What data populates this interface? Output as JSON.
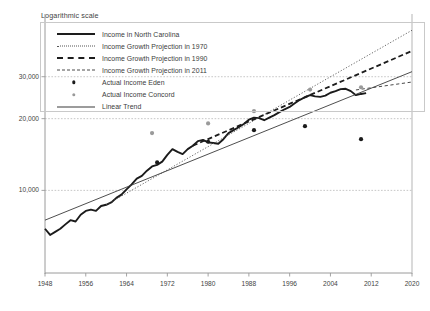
{
  "chart_data": {
    "type": "line",
    "title": "Logarithmic scale",
    "xlabel": "",
    "ylabel": "",
    "scale": "logarithmic",
    "grid": "horizontal",
    "legend_position": "top",
    "xlim": [
      1948,
      2020
    ],
    "ylim": [
      4500,
      55000
    ],
    "xticks": [
      "1948",
      "1956",
      "1964",
      "1972",
      "1980",
      "1988",
      "1996",
      "2004",
      "2012",
      "2020"
    ],
    "xtick_values": [
      1948,
      1956,
      1964,
      1972,
      1980,
      1988,
      1996,
      2004,
      2012,
      2020
    ],
    "yticks": [
      "10,000",
      "20,000",
      "30,000"
    ],
    "ytick_values": [
      10000,
      20000,
      30000
    ],
    "legend": [
      {
        "label": "Income in North Carolina",
        "key": "solid-thick"
      },
      {
        "label": "Income Growth Projection in 1970",
        "key": "dotted"
      },
      {
        "label": "Income Growth Projection in 1990",
        "key": "dashed-thick"
      },
      {
        "label": "Income Growth Projection in 2011",
        "key": "dashed-thin"
      },
      {
        "label": "Actual Income Eden",
        "key": "dot-dark"
      },
      {
        "label": "Actual Income Concord",
        "key": "dot-gray"
      },
      {
        "label": "Linear Trend",
        "key": "solid-thin"
      }
    ],
    "series": [
      {
        "name": "Income in North Carolina",
        "style": "solid-thick",
        "color": "#1b1b1b",
        "x": [
          1948,
          1949,
          1950,
          1951,
          1952,
          1953,
          1954,
          1955,
          1956,
          1957,
          1958,
          1959,
          1960,
          1961,
          1962,
          1963,
          1964,
          1965,
          1966,
          1967,
          1968,
          1969,
          1970,
          1971,
          1972,
          1973,
          1974,
          1975,
          1976,
          1977,
          1978,
          1979,
          1980,
          1981,
          1982,
          1983,
          1984,
          1985,
          1986,
          1987,
          1988,
          1989,
          1990,
          1991,
          1992,
          1993,
          1994,
          1995,
          1996,
          1997,
          1998,
          1999,
          2000,
          2001,
          2002,
          2003,
          2004,
          2005,
          2006,
          2007,
          2008,
          2009,
          2010,
          2011
        ],
        "values": [
          6900,
          6500,
          6700,
          6900,
          7200,
          7500,
          7400,
          7900,
          8200,
          8300,
          8200,
          8600,
          8700,
          8900,
          9300,
          9600,
          10100,
          10600,
          11200,
          11500,
          12100,
          12600,
          12800,
          13200,
          14100,
          14900,
          14500,
          14200,
          14900,
          15400,
          16100,
          16300,
          15900,
          15800,
          15700,
          16400,
          17400,
          17900,
          18400,
          19000,
          19800,
          20200,
          20100,
          19700,
          20200,
          20700,
          21300,
          21900,
          22400,
          23200,
          24000,
          24600,
          25100,
          24800,
          24700,
          25000,
          25700,
          26100,
          26600,
          26700,
          26100,
          25100,
          25400,
          25600
        ]
      },
      {
        "name": "Income Growth Projection in 1970",
        "style": "dotted",
        "color": "#555555",
        "x": [
          1960,
          2020
        ],
        "values": [
          8700,
          47000
        ]
      },
      {
        "name": "Income Growth Projection in 1990",
        "style": "dashed-thick",
        "color": "#1d1d1d",
        "x": [
          1977,
          2020
        ],
        "values": [
          15400,
          38500
        ]
      },
      {
        "name": "Income Growth Projection in 2011",
        "style": "dashed-thin",
        "color": "#4a4a4a",
        "x": [
          2009,
          2020
        ],
        "values": [
          26400,
          28500
        ]
      },
      {
        "name": "Linear Trend",
        "style": "solid-thin",
        "color": "#3a3a3a",
        "x": [
          1948,
          2020
        ],
        "values": [
          7500,
          31500
        ]
      }
    ],
    "scatter": [
      {
        "name": "Actual Income Eden",
        "style": "dot-dark",
        "color": "#1b1b1b",
        "points": [
          {
            "x": 1970,
            "y": 13100
          },
          {
            "x": 1980,
            "y": 16000
          },
          {
            "x": 1989,
            "y": 17900
          },
          {
            "x": 1999,
            "y": 18600
          },
          {
            "x": 2010,
            "y": 16400
          }
        ]
      },
      {
        "name": "Actual Income Concord",
        "style": "dot-gray",
        "color": "#9a9a9a",
        "points": [
          {
            "x": 1969,
            "y": 17400
          },
          {
            "x": 1980,
            "y": 19100
          },
          {
            "x": 1989,
            "y": 21500
          },
          {
            "x": 2000,
            "y": 26500
          },
          {
            "x": 2010,
            "y": 27100
          }
        ]
      }
    ]
  }
}
